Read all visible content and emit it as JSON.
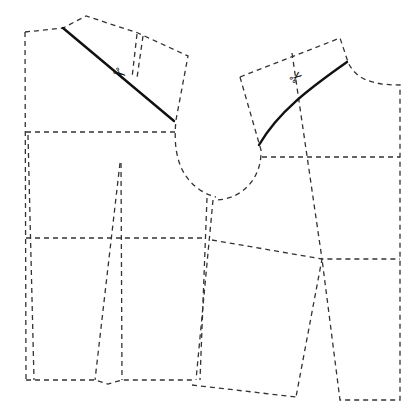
{
  "diagram": {
    "type": "sewing-pattern",
    "colors": {
      "outline": "#333333",
      "cut_line": "#111111",
      "background": "#ffffff"
    },
    "icons": {
      "scissors": "✂"
    },
    "left_piece": {
      "outline": [
        [
          25,
          32
        ],
        [
          62,
          28
        ],
        [
          85,
          16
        ],
        [
          140,
          33
        ],
        [
          188,
          55
        ],
        [
          175,
          120
        ],
        [
          176,
          160
        ],
        [
          186,
          178
        ],
        [
          204,
          196
        ],
        [
          214,
          200
        ],
        [
          202,
          382
        ],
        [
          192,
          382
        ],
        [
          120,
          380
        ],
        [
          100,
          383
        ],
        [
          95,
          380
        ],
        [
          30,
          380
        ],
        [
          25,
          32
        ]
      ],
      "waist_line": [
        [
          25,
          133
        ],
        [
          175,
          132
        ]
      ],
      "hip_line": [
        [
          26,
          238
        ],
        [
          205,
          238
        ]
      ],
      "dart_shoulder": [
        [
          138,
          35
        ],
        [
          132,
          75
        ]
      ],
      "dart_shoulder_2": [
        [
          143,
          35
        ],
        [
          137,
          75
        ]
      ],
      "dart_waist": [
        [
          121,
          163
        ],
        [
          97,
          380
        ],
        [
          121,
          163
        ],
        [
          122,
          380
        ]
      ],
      "cut_line": {
        "from": [
          63,
          28
        ],
        "to": [
          174,
          121
        ]
      },
      "scissors_pos": [
        120,
        75
      ]
    },
    "right_piece": {
      "outline": [
        [
          240,
          77
        ],
        [
          340,
          37
        ],
        [
          348,
          62
        ],
        [
          370,
          82
        ],
        [
          400,
          85
        ],
        [
          400,
          400
        ],
        [
          340,
          400
        ],
        [
          321,
          259
        ],
        [
          296,
          397
        ],
        [
          192,
          385
        ],
        [
          208,
          236
        ],
        [
          216,
          200
        ],
        [
          240,
          182
        ],
        [
          260,
          150
        ],
        [
          240,
          77
        ]
      ],
      "waist_line": [
        [
          262,
          157
        ],
        [
          400,
          157
        ]
      ],
      "hip_line": [
        [
          212,
          240
        ],
        [
          322,
          259
        ],
        [
          400,
          259
        ]
      ],
      "center_line": [
        [
          292,
          53
        ],
        [
          322,
          259
        ]
      ],
      "cut_line": {
        "from": [
          347,
          62
        ],
        "to": [
          259,
          145
        ]
      },
      "scissors_pos": [
        298,
        76
      ]
    }
  }
}
